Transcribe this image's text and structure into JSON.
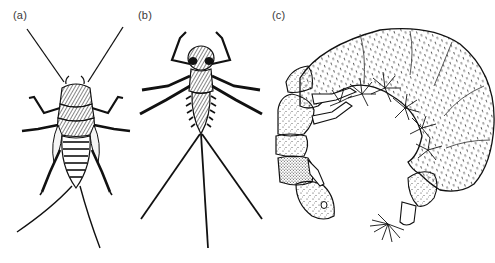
{
  "figure": {
    "panels": [
      {
        "id": "a",
        "label": "(a)",
        "subject": "stonefly-nymph"
      },
      {
        "id": "b",
        "label": "(b)",
        "subject": "mayfly-nymph"
      },
      {
        "id": "c",
        "label": "(c)",
        "subject": "caddisfly-larva"
      }
    ],
    "colors": {
      "ink": "#111111",
      "background": "#ffffff",
      "stipple": "#333333"
    }
  }
}
